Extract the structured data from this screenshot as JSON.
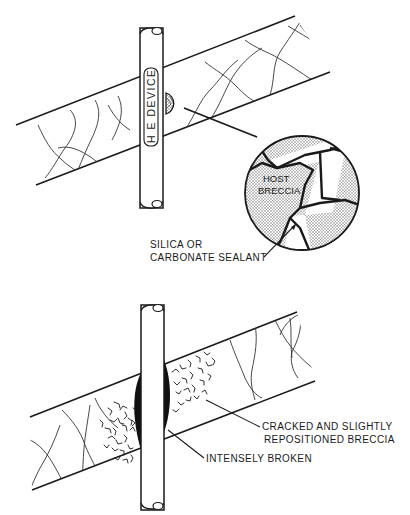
{
  "diagram": {
    "top_panel": {
      "device_label": "H E DEVICE",
      "inset_labels": {
        "host": [
          "HOST",
          "BRECCIA"
        ],
        "sealant": [
          "SILICA OR",
          "CARBONATE SEALANT"
        ]
      }
    },
    "bottom_panel": {
      "labels": {
        "cracked": [
          "CRACKED AND SLIGHTLY",
          "REPOSITIONED BRECCIA"
        ],
        "broken": "INTENSELY BROKEN"
      }
    },
    "colors": {
      "ink": "#1a1a1a",
      "background": "#ffffff",
      "stipple": "#8a8a8a"
    }
  }
}
